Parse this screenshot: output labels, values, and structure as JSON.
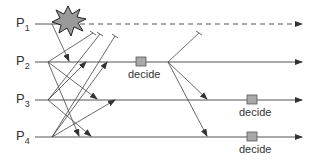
{
  "diagram": {
    "processes": [
      {
        "name": "P",
        "sub": "1",
        "y": 24,
        "crashed": true
      },
      {
        "name": "P",
        "sub": "2",
        "y": 62,
        "crashed": false
      },
      {
        "name": "P",
        "sub": "3",
        "y": 100,
        "crashed": false
      },
      {
        "name": "P",
        "sub": "4",
        "y": 137,
        "crashed": false
      }
    ],
    "decide_label": "decide",
    "decisions": [
      {
        "process": "P2",
        "x": 141,
        "y": 62,
        "label": "decide"
      },
      {
        "process": "P3",
        "x": 252,
        "y": 100,
        "label": "decide"
      },
      {
        "process": "P4",
        "x": 252,
        "y": 137,
        "label": "decide"
      }
    ],
    "crash_event": {
      "process": "P1",
      "x": 68,
      "y": 20
    },
    "colors": {
      "line": "#444444",
      "decide_box": "#a8a8a8",
      "star_fill": "#9a9a9a"
    }
  }
}
